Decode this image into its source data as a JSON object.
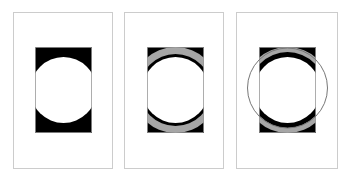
{
  "figure": {
    "panels": [
      {
        "id": "panel-1",
        "frame": {
          "x": 13,
          "y": 12,
          "w": 99,
          "h": 156
        },
        "rect": {
          "x": 35,
          "y": 47,
          "w": 57,
          "h": 86
        },
        "style": "solid-black-with-white-circle"
      },
      {
        "id": "panel-2",
        "frame": {
          "x": 124,
          "y": 12,
          "w": 99,
          "h": 156
        },
        "rect": {
          "x": 147,
          "y": 47,
          "w": 57,
          "h": 86
        },
        "style": "gray-band-with-black-ring"
      },
      {
        "id": "panel-3",
        "frame": {
          "x": 236,
          "y": 12,
          "w": 101,
          "h": 156
        },
        "rect": {
          "x": 259,
          "y": 47,
          "w": 57,
          "h": 86
        },
        "style": "gray-band-with-black-ring-and-outer-circle"
      }
    ],
    "colors": {
      "frame": "#cccccc",
      "fill_black": "#000000",
      "fill_gray": "#a6a6a6",
      "outline": "#888888",
      "background": "#ffffff"
    }
  }
}
